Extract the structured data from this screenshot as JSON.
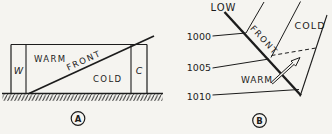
{
  "figure_title": "warm-front-diagram",
  "panel_a": {
    "caption": "A",
    "warm_label": "WARM",
    "front_label": "FRONT",
    "cold_label": "COLD",
    "warm_column": "W",
    "cold_column": "C"
  },
  "panel_b": {
    "caption": "B",
    "low_label": "LOW",
    "front_label": "FRONT",
    "cold_label": "COLD",
    "warm_label": "WARM",
    "isobars": [
      "1000",
      "1005",
      "1010"
    ]
  },
  "colors": {
    "ink": "#1c1c1c",
    "paper": "#f5f4f0"
  }
}
